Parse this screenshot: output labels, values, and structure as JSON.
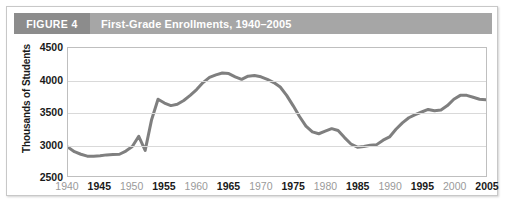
{
  "figure": {
    "number_label": "FIGURE 4",
    "title": "First-Grade Enrollments, 1940–2005",
    "number_block_color": "#8c8c8c",
    "title_block_color": "#a6a6a6",
    "header_text_color": "#ffffff"
  },
  "chart_data": {
    "type": "line",
    "title": "First-Grade Enrollments, 1940–2005",
    "xlabel": "",
    "ylabel": "Thousands of Students",
    "xlim": [
      1940,
      2005
    ],
    "ylim": [
      2500,
      4500
    ],
    "y_ticks": [
      2500,
      3000,
      3500,
      4000,
      4500
    ],
    "y_tick_labels": [
      "2500",
      "3000",
      "3500",
      "4000",
      "4500"
    ],
    "x_ticks": [
      1940,
      1945,
      1950,
      1955,
      1960,
      1965,
      1970,
      1975,
      1980,
      1985,
      1990,
      1995,
      2000,
      2005
    ],
    "x_tick_labels": [
      "1940",
      "1945",
      "1950",
      "1955",
      "1960",
      "1965",
      "1970",
      "1975",
      "1980",
      "1985",
      "1990",
      "1995",
      "2000",
      "2005"
    ],
    "x_tick_emphasis": [
      "minor",
      "major",
      "minor",
      "major",
      "minor",
      "major",
      "minor",
      "major",
      "minor",
      "major",
      "minor",
      "major",
      "minor",
      "major"
    ],
    "grid": "horizontal",
    "legend": "none",
    "line_color": "#7f7f7f",
    "line_width": 3,
    "series": [
      {
        "name": "First-grade enrollments",
        "x": [
          1940,
          1941,
          1942,
          1943,
          1944,
          1945,
          1946,
          1947,
          1948,
          1949,
          1950,
          1951,
          1952,
          1953,
          1954,
          1955,
          1956,
          1957,
          1958,
          1959,
          1960,
          1961,
          1962,
          1963,
          1964,
          1965,
          1966,
          1967,
          1968,
          1969,
          1970,
          1971,
          1972,
          1973,
          1974,
          1975,
          1976,
          1977,
          1978,
          1979,
          1980,
          1981,
          1982,
          1983,
          1984,
          1985,
          1986,
          1987,
          1988,
          1989,
          1990,
          1991,
          1992,
          1993,
          1994,
          1995,
          1996,
          1997,
          1998,
          1999,
          2000,
          2001,
          2002,
          2003,
          2004,
          2005
        ],
        "y": [
          2950,
          2880,
          2840,
          2810,
          2810,
          2815,
          2830,
          2835,
          2840,
          2890,
          2960,
          3120,
          2900,
          3380,
          3700,
          3640,
          3600,
          3620,
          3680,
          3760,
          3850,
          3960,
          4040,
          4080,
          4110,
          4100,
          4050,
          4010,
          4060,
          4070,
          4050,
          4010,
          3960,
          3890,
          3760,
          3600,
          3430,
          3280,
          3190,
          3160,
          3200,
          3240,
          3210,
          3100,
          3000,
          2950,
          2960,
          2980,
          2990,
          3060,
          3110,
          3230,
          3330,
          3410,
          3460,
          3500,
          3540,
          3520,
          3530,
          3600,
          3700,
          3760,
          3760,
          3730,
          3700,
          3690
        ],
        "notable": {
          "start_1940": 2950,
          "early_trough_1943": 2810,
          "bump_1951": 3120,
          "dip_1952": 2900,
          "peak_1964": 4110,
          "secondary_peak_1969": 4070,
          "bump_1981": 3240,
          "trough_1985": 2950,
          "peak_1997": 3760,
          "end_2005": 3690
        }
      }
    ]
  }
}
